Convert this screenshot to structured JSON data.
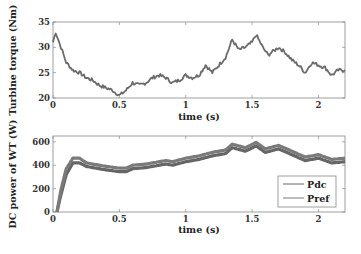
{
  "chart_data": [
    {
      "type": "line",
      "title": "",
      "xlabel": "time (s)",
      "ylabel": "Turbine torque (Nm)",
      "xlim": [
        0,
        2.2
      ],
      "ylim": [
        20,
        35
      ],
      "xticks": [
        0,
        0.5,
        1,
        1.5,
        2
      ],
      "xtick_labels": [
        "0",
        "0.5",
        "1",
        "1.5",
        "2"
      ],
      "yticks": [
        20,
        25,
        30,
        35
      ],
      "ytick_labels": [
        "20",
        "25",
        "30",
        "35"
      ],
      "grid": false,
      "legend": null,
      "series": [
        {
          "name": "Turbine torque",
          "color": "#6b6b6b",
          "x": [
            0,
            0.02,
            0.06,
            0.1,
            0.15,
            0.2,
            0.25,
            0.3,
            0.35,
            0.4,
            0.45,
            0.5,
            0.55,
            0.6,
            0.65,
            0.7,
            0.75,
            0.8,
            0.85,
            0.9,
            0.95,
            1.0,
            1.05,
            1.1,
            1.15,
            1.2,
            1.25,
            1.3,
            1.35,
            1.4,
            1.45,
            1.5,
            1.53,
            1.58,
            1.62,
            1.7,
            1.75,
            1.8,
            1.85,
            1.9,
            1.95,
            2.0,
            2.05,
            2.1,
            2.15,
            2.2
          ],
          "y": [
            31,
            33,
            30,
            27,
            25.5,
            25,
            24,
            23.5,
            22.5,
            22,
            21.5,
            20.5,
            21.5,
            23,
            22.5,
            23,
            24,
            24.5,
            24,
            23,
            23.5,
            24.5,
            24,
            24.5,
            26.5,
            25,
            26.5,
            28,
            31.5,
            29.5,
            30,
            31,
            32.5,
            30,
            28.5,
            30,
            29,
            27.5,
            26.5,
            25,
            27,
            26.5,
            26,
            24.5,
            25.5,
            25.5
          ]
        }
      ]
    },
    {
      "type": "line",
      "title": "",
      "xlabel": "time (s)",
      "ylabel": "DC power of WT (W)",
      "xlim": [
        0,
        2.2
      ],
      "ylim": [
        0,
        650
      ],
      "xticks": [
        0,
        0.5,
        1,
        1.5,
        2
      ],
      "xtick_labels": [
        "0",
        "0.5",
        "1",
        "1.5",
        "2"
      ],
      "yticks": [
        0,
        200,
        400,
        600
      ],
      "ytick_labels": [
        "0",
        "200",
        "400",
        "600"
      ],
      "grid": false,
      "legend": {
        "position": "lower right",
        "entries": [
          "Pdc",
          "Pref"
        ]
      },
      "series": [
        {
          "name": "Pdc",
          "color": "#666666",
          "x": [
            0.03,
            0.06,
            0.1,
            0.15,
            0.2,
            0.25,
            0.3,
            0.4,
            0.5,
            0.55,
            0.6,
            0.7,
            0.75,
            0.85,
            0.9,
            1.0,
            1.1,
            1.2,
            1.3,
            1.35,
            1.45,
            1.53,
            1.6,
            1.7,
            1.8,
            1.9,
            2.0,
            2.1,
            2.2
          ],
          "y": [
            0,
            150,
            320,
            420,
            420,
            390,
            380,
            360,
            345,
            345,
            370,
            380,
            390,
            410,
            400,
            430,
            450,
            480,
            500,
            550,
            520,
            565,
            510,
            540,
            490,
            440,
            460,
            420,
            430
          ]
        },
        {
          "name": "Pref",
          "color": "#7a7a7a",
          "x": [
            0.03,
            0.06,
            0.1,
            0.15,
            0.2,
            0.25,
            0.3,
            0.4,
            0.5,
            0.55,
            0.6,
            0.7,
            0.75,
            0.85,
            0.9,
            1.0,
            1.1,
            1.2,
            1.3,
            1.35,
            1.45,
            1.53,
            1.6,
            1.7,
            1.8,
            1.9,
            2.0,
            2.1,
            2.2
          ],
          "y": [
            0,
            190,
            370,
            460,
            460,
            420,
            410,
            390,
            375,
            375,
            400,
            410,
            420,
            440,
            430,
            460,
            480,
            510,
            530,
            580,
            550,
            595,
            540,
            570,
            520,
            470,
            490,
            450,
            460
          ]
        }
      ]
    }
  ],
  "plots": {
    "top": {
      "ylabel": "Turbine torque (Nm)",
      "xlabel": "time (s)"
    },
    "bottom": {
      "ylabel": "DC power of WT (W)",
      "xlabel": "time (s)",
      "legend": [
        "Pdc",
        "Pref"
      ]
    }
  }
}
